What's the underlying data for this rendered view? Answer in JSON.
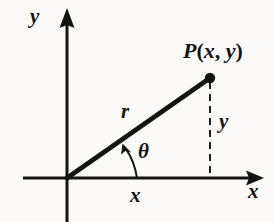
{
  "figure": {
    "name": "polar-coordinates-right-triangle-diagram",
    "background_color": "#fbfaf8",
    "ink_color": "#141414",
    "labels": {
      "axis_y": "y",
      "axis_x": "x",
      "point": {
        "name": "P",
        "open_paren": "(",
        "coord_x": "x",
        "comma": ", ",
        "coord_y": "y",
        "close_paren": ")",
        "full": "P(x, y)"
      },
      "radius": "r",
      "leg_vertical": "y",
      "leg_horizontal": "x",
      "angle": "θ"
    },
    "geometry": {
      "origin": [
        67,
        178
      ],
      "point": [
        210,
        78
      ],
      "x_axis_start": [
        23,
        178
      ],
      "x_axis_end": [
        264,
        178
      ],
      "y_axis_top": [
        67,
        8
      ],
      "y_axis_bottom": [
        67,
        222
      ],
      "angle_arc_start": [
        137,
        178
      ],
      "angle_arc_end": [
        124,
        146
      ],
      "dashed_line_from": [
        210,
        82
      ],
      "dashed_line_to": [
        210,
        178
      ],
      "point_dot_radius": 5,
      "radius_line_width": 4.5,
      "axis_line_width": 3,
      "dash_pattern": "7 5"
    }
  }
}
